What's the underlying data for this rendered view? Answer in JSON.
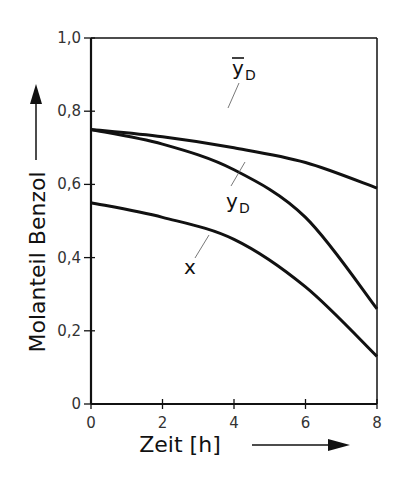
{
  "chart_data": {
    "type": "line",
    "title": "",
    "xlabel": "Zeit [h]",
    "ylabel": "Molanteil Benzol",
    "xlim": [
      0,
      8
    ],
    "ylim": [
      0,
      1.0
    ],
    "x_ticks": [
      "0",
      "2",
      "4",
      "6",
      "8"
    ],
    "y_ticks": [
      "0",
      "0,2",
      "0,4",
      "0,6",
      "0,8",
      "1,0"
    ],
    "grid": false,
    "x": [
      0,
      2,
      4,
      6,
      8
    ],
    "series": [
      {
        "name": "ȳD",
        "label_main": "y",
        "label_sub": "D",
        "overbar": true,
        "values": [
          0.75,
          0.73,
          0.7,
          0.66,
          0.59
        ]
      },
      {
        "name": "yD",
        "label_main": "y",
        "label_sub": "D",
        "overbar": false,
        "values": [
          0.75,
          0.71,
          0.64,
          0.51,
          0.26
        ]
      },
      {
        "name": "x",
        "label_main": "x",
        "label_sub": "",
        "overbar": false,
        "values": [
          0.55,
          0.51,
          0.45,
          0.32,
          0.13
        ]
      }
    ]
  }
}
